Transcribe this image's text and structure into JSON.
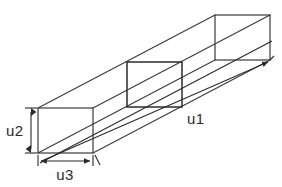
{
  "diagram": {
    "type": "engineering-line-drawing",
    "background_color": "#ffffff",
    "line_color": "#3a3a3a",
    "line_color_dark": "#2b2b2b",
    "text_color": "#2b2b2b"
  },
  "labels": {
    "length": "u1",
    "height": "u2",
    "width": "u3"
  },
  "geometry": {
    "projection": "isometric",
    "front_face": {
      "x": 38,
      "y": 108,
      "width": 55,
      "height": 45
    },
    "middle_face": {
      "x": 127,
      "y": 62,
      "width": 55,
      "height": 45
    },
    "back_face": {
      "x": 215,
      "y": 15,
      "width": 55,
      "height": 45
    },
    "depth_offset": {
      "dx": 177,
      "dy": -93
    }
  },
  "dimensions": {
    "u1": {
      "label": "u1",
      "orientation": "diagonal",
      "from": [
        46,
        160
      ],
      "to": [
        268,
        64
      ]
    },
    "u2": {
      "label": "u2",
      "orientation": "vertical",
      "from": [
        31,
        108
      ],
      "to": [
        31,
        153
      ]
    },
    "u3": {
      "label": "u3",
      "orientation": "horizontal",
      "from": [
        38,
        161
      ],
      "to": [
        93,
        161
      ]
    }
  }
}
